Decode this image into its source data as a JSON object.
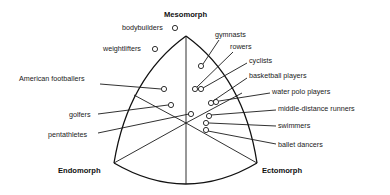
{
  "diagram": {
    "type": "somatochart",
    "vertices": {
      "top": "Mesomorph",
      "bottom_left": "Endomorph",
      "bottom_right": "Ectomorph"
    },
    "groups": [
      {
        "label": "bodybuilders",
        "side": "left"
      },
      {
        "label": "weightlifters",
        "side": "left"
      },
      {
        "label": "American footballers",
        "side": "left"
      },
      {
        "label": "golfers",
        "side": "left"
      },
      {
        "label": "pentathletes",
        "side": "left"
      },
      {
        "label": "gymnasts",
        "side": "right"
      },
      {
        "label": "rowers",
        "side": "right"
      },
      {
        "label": "cyclists",
        "side": "right"
      },
      {
        "label": "basketball players",
        "side": "right"
      },
      {
        "label": "water polo players",
        "side": "right"
      },
      {
        "label": "middle-distance runners",
        "side": "right"
      },
      {
        "label": "swimmers",
        "side": "right"
      },
      {
        "label": "ballet dancers",
        "side": "right"
      }
    ]
  }
}
